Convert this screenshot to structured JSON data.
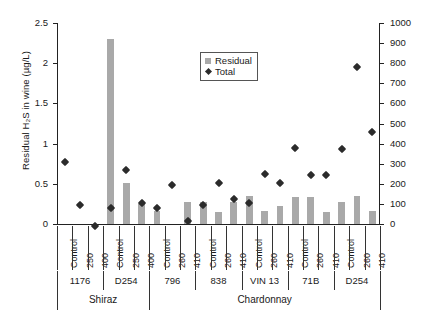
{
  "chart_data": {
    "type": "bar",
    "title": "",
    "xlabel": "",
    "ylabel": "Residual H2S in wine (ug/L)",
    "y2label": "Total H2S produced (ug/L)",
    "ylim": [
      0,
      2.5
    ],
    "y2lim": [
      0,
      1000
    ],
    "yticks": [
      "0",
      "0.5",
      "1",
      "1.5",
      "2",
      "2.5"
    ],
    "ytick_values": [
      0,
      0.5,
      1,
      1.5,
      2,
      2.5
    ],
    "y2ticks": [
      "0",
      "100",
      "200",
      "300",
      "400",
      "500",
      "600",
      "700",
      "800",
      "900",
      "1000"
    ],
    "y2tick_values": [
      0,
      100,
      200,
      300,
      400,
      500,
      600,
      700,
      800,
      900,
      1000
    ],
    "grid": false,
    "legend_position": "upper center",
    "legend": [
      {
        "label": "Residual",
        "marker": "square",
        "color": "#a9a9a9"
      },
      {
        "label": "Total",
        "marker": "diamond",
        "color": "#2b2b2b"
      }
    ],
    "categories": [
      "Control",
      "250",
      "400",
      "Control",
      "250",
      "400",
      "Control",
      "260",
      "410",
      "Control",
      "260",
      "410",
      "Control",
      "260",
      "410",
      "Control",
      "260",
      "410",
      "Control",
      "260",
      "410"
    ],
    "series": [
      {
        "name": "Residual",
        "axis": "left",
        "units": "ug/L",
        "values": [
          0.0,
          0.0,
          0.0,
          2.3,
          0.51,
          0.25,
          0.16,
          0.0,
          0.27,
          0.28,
          0.15,
          0.27,
          0.35,
          0.16,
          0.22,
          0.34,
          0.34,
          0.15,
          0.27,
          0.35,
          0.16
        ]
      },
      {
        "name": "Total",
        "axis": "right",
        "units": "ug/L",
        "values": [
          330,
          115,
          10,
          100,
          290,
          125,
          215,
          0,
          225,
          115,
          55,
          145,
          125,
          230,
          270,
          225,
          270,
          400,
          260,
          350,
          800
        ]
      }
    ],
    "groups_strain": [
      {
        "label": "1176",
        "span": 3
      },
      {
        "label": "D254",
        "span": 3
      },
      {
        "label": "796",
        "span": 3
      },
      {
        "label": "838",
        "span": 3
      },
      {
        "label": "VIN 13",
        "span": 3
      },
      {
        "label": "71B",
        "span": 3
      },
      {
        "label": "D254",
        "span": 3
      }
    ],
    "groups_variety": [
      {
        "label": "Shiraz",
        "span": 6
      },
      {
        "label": "Chardonnay",
        "span": 15
      }
    ]
  },
  "axes": {
    "left_title": "Residual H₂S  in wine (µg/L)",
    "right_title": "Total H₂S produced (µg/L)"
  },
  "points": {
    "residual": [
      {
        "cat": "Control",
        "v": 0.0
      },
      {
        "cat": "250",
        "v": 0.0
      },
      {
        "cat": "400",
        "v": 0.0
      },
      {
        "cat": "Control",
        "v": 0.0
      },
      {
        "cat": "250",
        "v": 2.3
      },
      {
        "cat": "400",
        "v": 0.51
      },
      {
        "cat": "Control",
        "v": 0.25
      },
      {
        "cat": "260",
        "v": 0.16
      },
      {
        "cat": "410",
        "v": 0.0
      },
      {
        "cat": "Control",
        "v": 0.27
      },
      {
        "cat": "260",
        "v": 0.28
      },
      {
        "cat": "410",
        "v": 0.15
      },
      {
        "cat": "Control",
        "v": 0.2
      },
      {
        "cat": "260",
        "v": 0.35
      },
      {
        "cat": "410",
        "v": 0.16
      },
      {
        "cat": "Control",
        "v": 0.33
      },
      {
        "cat": "260",
        "v": 0.34
      },
      {
        "cat": "410",
        "v": 0.15
      },
      {
        "cat": "Control",
        "v": 0.28
      },
      {
        "cat": "260",
        "v": 0.35
      },
      {
        "cat": "410",
        "v": 0.16
      }
    ],
    "total": [
      {
        "cat": "Control",
        "v": 330
      },
      {
        "cat": "250",
        "v": 115
      },
      {
        "cat": "400",
        "v": 10
      },
      {
        "cat": "Control",
        "v": 100
      },
      {
        "cat": "250",
        "v": 290
      },
      {
        "cat": "400",
        "v": 125
      },
      {
        "cat": "Control",
        "v": 100
      },
      {
        "cat": "260",
        "v": 215
      },
      {
        "cat": "410",
        "v": 35
      },
      {
        "cat": "Control",
        "v": 115
      },
      {
        "cat": "260",
        "v": 225
      },
      {
        "cat": "410",
        "v": 145
      },
      {
        "cat": "Control",
        "v": 125
      },
      {
        "cat": "260",
        "v": 270
      },
      {
        "cat": "410",
        "v": 225
      },
      {
        "cat": "Control",
        "v": 400
      },
      {
        "cat": "260",
        "v": 265
      },
      {
        "cat": "410",
        "v": 265
      },
      {
        "cat": "Control",
        "v": 395
      },
      {
        "cat": "260",
        "v": 800
      },
      {
        "cat": "410",
        "v": 480
      }
    ]
  }
}
